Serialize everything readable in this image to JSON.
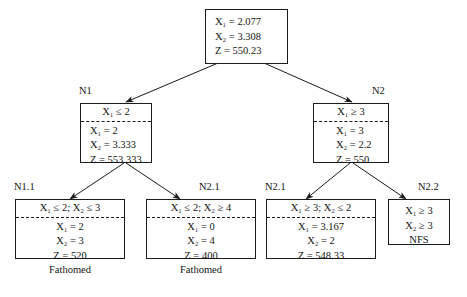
{
  "diagram": {
    "type": "branch-and-bound-tree"
  },
  "nodes": {
    "root": {
      "label": "",
      "header": "",
      "rows": [
        "X₁ = 2.077",
        "X₂ = 3.308",
        "Z  = 550.23"
      ],
      "status": ""
    },
    "n1": {
      "label": "N1",
      "header": "X₁ ≤ 2",
      "rows": [
        "X₁ = 2",
        "X₂ = 3.333",
        "Z  = 553.333"
      ],
      "status": ""
    },
    "n2": {
      "label": "N2",
      "header": "X₁ ≥ 3",
      "rows": [
        "X₁ = 3",
        "X₂ = 2.2",
        "Z  = 550"
      ],
      "status": ""
    },
    "n11": {
      "label": "N1.1",
      "header": "X₁ ≤ 2;  X₂ ≤ 3",
      "rows": [
        "X₁ = 2",
        "X₂ = 3",
        "Z  = 520"
      ],
      "status": "Fathomed"
    },
    "n21left": {
      "label": "N2.1",
      "header": "X₁ ≤ 2;  X₂ ≥ 4",
      "rows": [
        "X₁ = 0",
        "X₂ = 4",
        "Z  = 400"
      ],
      "status": "Fathomed"
    },
    "n21right": {
      "label": "N2.1",
      "header": "X₁ ≥ 3;  X₂ ≤ 2",
      "rows": [
        "X₁ = 3.167",
        "X₂ = 2",
        "Z  = 548.33"
      ],
      "status": ""
    },
    "n22": {
      "label": "N2.2",
      "header": "",
      "rows": [
        "X₁ ≥ 3",
        "X₂ ≥ 3",
        "NFS"
      ],
      "status": ""
    }
  },
  "colors": {
    "background": "#ffffff",
    "stroke": "#1a1a1a",
    "text": "#141414"
  }
}
